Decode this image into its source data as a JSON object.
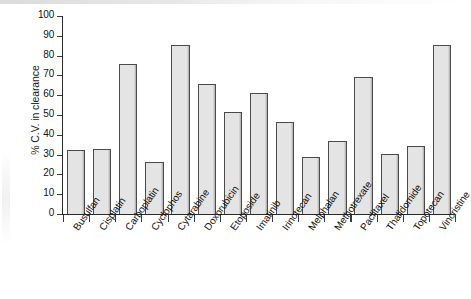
{
  "chart_data": {
    "type": "bar",
    "title": "",
    "xlabel": "",
    "ylabel": "% C.V. in clearance",
    "ylim": [
      0,
      100
    ],
    "ytick_values": [
      0,
      10,
      20,
      30,
      40,
      50,
      60,
      70,
      80,
      90,
      100
    ],
    "ytick_labels": [
      "0",
      "10",
      "20",
      "30",
      "40",
      "50",
      "60",
      "70",
      "80",
      "90",
      "100"
    ],
    "grid": false,
    "legend": null,
    "categories": [
      "Busulfan",
      "Cisplatin",
      "Carboplatin",
      "Cyclophos",
      "Cytarabine",
      "Doxorubicin",
      "Etoposide",
      "Imatinib",
      "Irinotecan",
      "Melphalan",
      "Methotrexate",
      "Paclitaxel",
      "Thalidomide",
      "Topotecan",
      "Vincristine"
    ],
    "values": [
      32.5,
      33,
      76,
      26.5,
      85.5,
      65.5,
      51.5,
      61,
      46.5,
      29,
      37,
      69,
      30.5,
      34.5,
      85.5
    ],
    "bar_fill_color": "#e4e4e4",
    "bar_edge_color": "#4a4a4a",
    "axis_color": "#2a2a2a"
  }
}
